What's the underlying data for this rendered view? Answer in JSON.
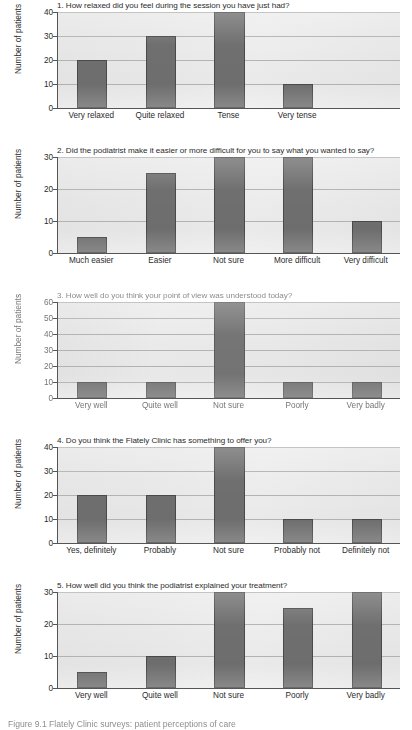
{
  "figure": {
    "caption": "Figure 9.1  Flately Clinic surveys: patient perceptions of care",
    "ylabel": "Number of patients",
    "ylabel_degraded": "Number of patients",
    "bar_color": "#6f6f6f",
    "plot_background": "#e9e9e9",
    "gridline_color": "#b4b4b4",
    "axis_color": "#555555"
  },
  "chart_data": [
    {
      "type": "bar",
      "title": "1. How relaxed did you feel during the session you have just had?",
      "categories": [
        "Very relaxed",
        "Quite relaxed",
        "Tense",
        "Very tense"
      ],
      "values": [
        20,
        30,
        40,
        10
      ],
      "xlabel": "",
      "ylabel": "Number of patients",
      "ylim": [
        0,
        40
      ],
      "yticks": [
        0,
        10,
        20,
        30,
        40
      ],
      "grid": true,
      "slots": 5
    },
    {
      "type": "bar",
      "title": "2. Did the podiatrist make it easier or more difficult for you to say what you wanted to say?",
      "categories": [
        "Much easier",
        "Easier",
        "Not sure",
        "More difficult",
        "Very difficult"
      ],
      "values": [
        5,
        25,
        30,
        30,
        10
      ],
      "xlabel": "",
      "ylabel": "Number of patients",
      "ylim": [
        0,
        30
      ],
      "yticks": [
        0,
        10,
        20,
        30
      ],
      "grid": true,
      "slots": 5
    },
    {
      "type": "bar",
      "title": "3. How well do you think your point of view was understood today?",
      "categories": [
        "Very well",
        "Quite well",
        "Not sure",
        "Poorly",
        "Very badly"
      ],
      "values": [
        10,
        10,
        60,
        10,
        10
      ],
      "xlabel": "",
      "ylabel": "Number of patients",
      "ylim": [
        0,
        60
      ],
      "yticks": [
        0,
        10,
        20,
        30,
        40,
        50,
        60
      ],
      "grid": true,
      "slots": 5,
      "degraded": true
    },
    {
      "type": "bar",
      "title": "4. Do you think the Flately Clinic has something to offer you?",
      "categories": [
        "Yes, definitely",
        "Probably",
        "Not sure",
        "Probably not",
        "Definitely not"
      ],
      "values": [
        20,
        20,
        40,
        10,
        10
      ],
      "xlabel": "",
      "ylabel": "Number of patients",
      "ylim": [
        0,
        40
      ],
      "yticks": [
        0,
        10,
        20,
        30,
        40
      ],
      "grid": true,
      "slots": 5
    },
    {
      "type": "bar",
      "title": "5. How well did you think the podiatrist explained your treatment?",
      "categories": [
        "Very well",
        "Quite well",
        "Not sure",
        "Poorly",
        "Very badly"
      ],
      "values": [
        5,
        10,
        30,
        25,
        30
      ],
      "xlabel": "",
      "ylabel": "Number of patients",
      "ylim": [
        0,
        30
      ],
      "yticks": [
        0,
        10,
        20,
        30
      ],
      "grid": true,
      "slots": 5
    }
  ]
}
